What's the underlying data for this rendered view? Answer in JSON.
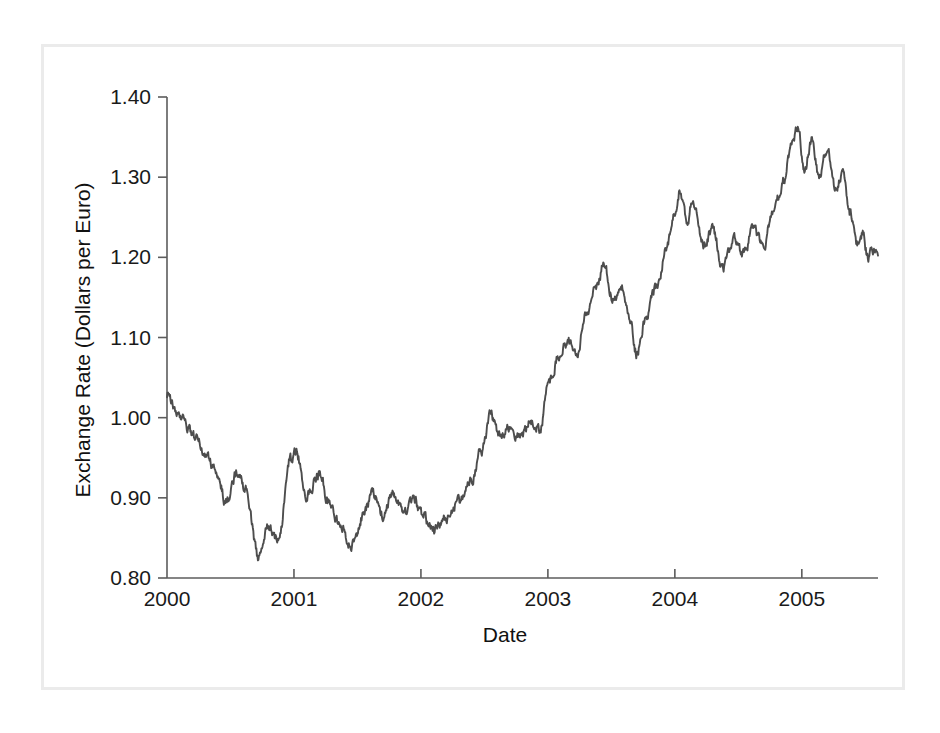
{
  "figure": {
    "background_color": "#ffffff",
    "frame_color": "#ebebeb",
    "line_color": "#4d4d4d",
    "axis_color": "#5c5c5c",
    "text_color": "#1a1a1a"
  },
  "chart_data": {
    "type": "line",
    "title": "",
    "subtitle": "",
    "xlabel": "Date",
    "ylabel": "Exchange Rate (Dollars per Euro)",
    "xlim": [
      2000.0,
      2005.6
    ],
    "ylim": [
      0.8,
      1.4
    ],
    "grid": false,
    "legend": false,
    "legend_position": "none",
    "x_ticks": [
      2000,
      2001,
      2002,
      2003,
      2004,
      2005
    ],
    "x_tick_labels": [
      "2000",
      "2001",
      "2002",
      "2003",
      "2004",
      "2005"
    ],
    "y_ticks": [
      0.8,
      0.9,
      1.0,
      1.1,
      1.2,
      1.3,
      1.4
    ],
    "y_tick_labels": [
      "0.80",
      "0.90",
      "1.00",
      "1.10",
      "1.20",
      "1.30",
      "1.40"
    ],
    "series": [
      {
        "name": "USD per EUR",
        "x": [
          2000.0,
          2000.02,
          2000.04,
          2000.06,
          2000.08,
          2000.1,
          2000.12,
          2000.14,
          2000.16,
          2000.18,
          2000.2,
          2000.22,
          2000.24,
          2000.26,
          2000.28,
          2000.3,
          2000.32,
          2000.34,
          2000.36,
          2000.38,
          2000.4,
          2000.42,
          2000.44,
          2000.46,
          2000.48,
          2000.5,
          2000.52,
          2000.54,
          2000.56,
          2000.58,
          2000.6,
          2000.62,
          2000.64,
          2000.66,
          2000.68,
          2000.7,
          2000.72,
          2000.74,
          2000.76,
          2000.78,
          2000.8,
          2000.82,
          2000.84,
          2000.86,
          2000.88,
          2000.9,
          2000.92,
          2000.94,
          2000.96,
          2000.98,
          2001.0,
          2001.02,
          2001.04,
          2001.06,
          2001.08,
          2001.1,
          2001.12,
          2001.14,
          2001.16,
          2001.18,
          2001.2,
          2001.22,
          2001.24,
          2001.26,
          2001.28,
          2001.3,
          2001.32,
          2001.34,
          2001.36,
          2001.38,
          2001.4,
          2001.42,
          2001.44,
          2001.46,
          2001.48,
          2001.5,
          2001.52,
          2001.54,
          2001.56,
          2001.58,
          2001.6,
          2001.62,
          2001.64,
          2001.66,
          2001.68,
          2001.7,
          2001.72,
          2001.74,
          2001.76,
          2001.78,
          2001.8,
          2001.82,
          2001.84,
          2001.86,
          2001.88,
          2001.9,
          2001.92,
          2001.94,
          2001.96,
          2001.98,
          2002.0,
          2002.02,
          2002.04,
          2002.06,
          2002.08,
          2002.1,
          2002.12,
          2002.14,
          2002.16,
          2002.18,
          2002.2,
          2002.22,
          2002.24,
          2002.26,
          2002.28,
          2002.3,
          2002.32,
          2002.34,
          2002.36,
          2002.38,
          2002.4,
          2002.42,
          2002.44,
          2002.46,
          2002.48,
          2002.5,
          2002.52,
          2002.54,
          2002.56,
          2002.58,
          2002.6,
          2002.62,
          2002.64,
          2002.66,
          2002.68,
          2002.7,
          2002.72,
          2002.74,
          2002.76,
          2002.78,
          2002.8,
          2002.82,
          2002.84,
          2002.86,
          2002.88,
          2002.9,
          2002.92,
          2002.94,
          2002.96,
          2002.98,
          2003.0,
          2003.02,
          2003.04,
          2003.06,
          2003.08,
          2003.1,
          2003.12,
          2003.14,
          2003.16,
          2003.18,
          2003.2,
          2003.22,
          2003.24,
          2003.26,
          2003.28,
          2003.3,
          2003.32,
          2003.34,
          2003.36,
          2003.38,
          2003.4,
          2003.42,
          2003.44,
          2003.46,
          2003.48,
          2003.5,
          2003.52,
          2003.54,
          2003.56,
          2003.58,
          2003.6,
          2003.62,
          2003.64,
          2003.66,
          2003.68,
          2003.7,
          2003.72,
          2003.74,
          2003.76,
          2003.78,
          2003.8,
          2003.82,
          2003.84,
          2003.86,
          2003.88,
          2003.9,
          2003.92,
          2003.94,
          2003.96,
          2003.98,
          2004.0,
          2004.02,
          2004.04,
          2004.06,
          2004.08,
          2004.1,
          2004.12,
          2004.14,
          2004.16,
          2004.18,
          2004.2,
          2004.22,
          2004.24,
          2004.26,
          2004.28,
          2004.3,
          2004.32,
          2004.34,
          2004.36,
          2004.38,
          2004.4,
          2004.42,
          2004.44,
          2004.46,
          2004.48,
          2004.5,
          2004.52,
          2004.54,
          2004.56,
          2004.58,
          2004.6,
          2004.62,
          2004.64,
          2004.66,
          2004.68,
          2004.7,
          2004.72,
          2004.74,
          2004.76,
          2004.78,
          2004.8,
          2004.82,
          2004.84,
          2004.86,
          2004.88,
          2004.9,
          2004.92,
          2004.94,
          2004.96,
          2004.98,
          2005.0,
          2005.02,
          2005.04,
          2005.06,
          2005.08,
          2005.1,
          2005.12,
          2005.14,
          2005.16,
          2005.18,
          2005.2,
          2005.22,
          2005.24,
          2005.26,
          2005.28,
          2005.3,
          2005.32,
          2005.34,
          2005.36,
          2005.38,
          2005.4,
          2005.42,
          2005.44,
          2005.46,
          2005.48,
          2005.5,
          2005.52,
          2005.54
        ],
        "y": [
          1.012,
          1.03,
          1.022,
          1.035,
          1.01,
          1.0,
          0.998,
          0.992,
          0.985,
          0.99,
          0.978,
          0.982,
          0.97,
          0.976,
          0.963,
          0.97,
          0.958,
          0.964,
          0.952,
          0.947,
          0.955,
          0.94,
          0.946,
          0.935,
          0.941,
          0.93,
          0.936,
          0.925,
          0.92,
          0.931,
          0.918,
          0.908,
          0.912,
          0.9,
          0.905,
          0.893,
          0.899,
          0.902,
          0.915,
          0.925,
          0.933,
          0.927,
          0.938,
          0.93,
          0.92,
          0.927,
          0.915,
          0.906,
          0.912,
          0.9,
          0.89,
          0.896,
          0.884,
          0.876,
          0.882,
          0.87,
          0.862,
          0.872,
          0.858,
          0.866,
          0.85,
          0.858,
          0.845,
          0.855,
          0.84,
          0.848,
          0.835,
          0.845,
          0.828,
          0.838,
          0.825,
          0.834,
          0.845,
          0.86,
          0.875,
          0.89,
          0.905,
          0.92,
          0.935,
          0.948,
          0.955,
          0.945,
          0.952,
          0.938,
          0.944,
          0.93,
          0.938,
          0.925,
          0.932,
          0.918,
          0.925,
          0.912,
          0.92,
          0.906,
          0.913,
          0.9,
          0.908,
          0.895,
          0.902,
          0.89,
          0.897,
          0.884,
          0.892,
          0.878,
          0.885,
          0.872,
          0.88,
          0.866,
          0.874,
          0.86,
          0.868,
          0.855,
          0.862,
          0.85,
          0.858,
          0.845,
          0.852,
          0.84,
          0.848,
          0.858,
          0.868,
          0.88,
          0.89,
          0.898,
          0.888,
          0.896,
          0.885,
          0.893,
          0.882,
          0.89,
          0.878,
          0.888,
          0.876,
          0.886,
          0.895,
          0.905,
          0.898,
          0.906,
          0.896,
          0.904,
          0.893,
          0.901,
          0.89,
          0.898,
          0.888,
          0.896,
          0.886,
          0.894,
          0.884,
          0.892,
          0.882,
          0.89,
          0.88,
          0.888,
          0.878,
          0.886,
          0.876,
          0.884,
          0.875,
          0.882,
          0.874,
          0.881,
          0.873,
          0.88,
          0.872,
          0.879,
          0.87,
          0.876,
          0.868,
          0.874,
          0.866,
          0.873,
          0.88,
          0.888,
          0.896,
          0.904,
          0.895,
          0.902,
          0.893,
          0.9,
          0.892,
          0.899,
          0.89,
          0.898,
          0.888,
          0.896,
          0.886,
          0.894,
          0.885,
          0.893,
          0.884,
          0.892,
          0.883,
          0.89,
          0.882,
          0.889,
          0.88,
          0.888,
          0.879,
          0.886,
          0.878,
          0.885,
          0.877,
          0.884,
          0.876,
          0.883,
          0.875,
          0.882,
          0.874,
          0.881,
          0.873,
          0.88,
          0.872,
          0.879,
          0.871,
          0.878,
          0.87,
          0.877,
          0.869,
          0.876,
          0.868,
          0.875,
          0.867,
          0.874,
          0.866,
          0.873,
          0.865,
          0.872,
          0.864,
          0.871,
          0.863,
          0.87,
          0.862,
          0.869,
          0.861,
          0.868,
          0.86,
          0.867,
          0.859,
          0.866,
          0.858,
          0.865,
          0.857,
          0.864,
          0.856,
          0.863,
          0.855,
          0.862,
          0.854,
          0.861,
          0.853,
          0.86,
          0.852,
          0.859,
          0.851,
          0.858,
          0.85,
          0.857,
          0.849,
          0.856,
          0.848,
          0.855,
          0.847,
          0.854,
          0.846,
          0.853,
          0.845,
          0.852,
          0.844,
          0.851,
          0.843,
          0.85,
          0.842,
          0.849,
          0.841,
          0.848,
          0.84,
          0.847
        ],
        "color": "#4d4d4d"
      }
    ],
    "notable_values": {
      "start_2000": 1.03,
      "min_value": 0.825,
      "min_date": "2000.72",
      "max_value": 1.36,
      "max_date": "2004.97",
      "end_value": 1.21,
      "end_date": "2005.55",
      "local_peak_2001_early": 0.955,
      "local_trough_2001_mid": 0.838,
      "level_2002_start": 0.86,
      "level_2003_start": 1.04,
      "local_peak_2003_mid": 1.19,
      "local_trough_2003_late": 1.08,
      "local_peak_2004_early": 1.285,
      "local_trough_2004_mid": 1.185
    }
  }
}
